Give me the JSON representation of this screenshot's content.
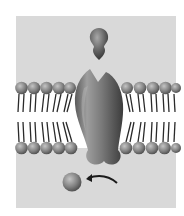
{
  "diagram": {
    "colors": {
      "background": "#ffffff",
      "fluid": "#d9d9d9",
      "membrane_core": "#ffffff",
      "head_light": "#b5b5b5",
      "head_dark": "#4a4a4a",
      "tail": "#2a2a2a",
      "receptor_light": "#9a9a9a",
      "receptor_dark": "#3c3c3c",
      "arrow": "#1a1a1a"
    },
    "elements": {
      "ligand": "ligand-molecule",
      "receptor": "transmembrane-receptor",
      "released_molecule": "released-molecule",
      "arrow": "curved-arrow"
    }
  }
}
